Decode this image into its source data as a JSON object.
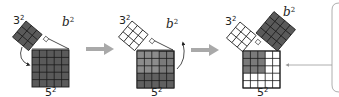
{
  "diagram": {
    "colors": {
      "dark_fill": "#5a5a5a",
      "mid_fill": "#7a7a7a",
      "grid_line": "#1a1a1a",
      "arrow_gray": "#a9a9a9",
      "bracket_gray": "#9a9a9a",
      "white": "#ffffff"
    },
    "panels": [
      {
        "id": "panel-1",
        "labels": {
          "small_square": "3",
          "small_exp": "2",
          "leg": "b",
          "leg_exp": "2",
          "big_square": "5",
          "big_exp": "2"
        },
        "small_square_fill": "dark",
        "big_square_fill": "dark",
        "arrow": "curved arrow from 3² square down to 5² square"
      },
      {
        "id": "panel-2",
        "labels": {
          "small_square": "3",
          "small_exp": "2",
          "leg": "b",
          "leg_exp": "2",
          "big_square": "5",
          "big_exp": "2"
        },
        "small_square_fill": "white",
        "big_square_fill": "mixed",
        "arrow": "curved arrow from 5² square up toward b² side"
      },
      {
        "id": "panel-3",
        "labels": {
          "small_square": "3",
          "small_exp": "2",
          "leg": "b",
          "leg_exp": "2",
          "big_square": "5",
          "big_exp": "2"
        },
        "small_square_fill": "white",
        "b_square_fill": "dark",
        "big_square_fill": "partial: top-left 3x3 gray, remainder white"
      }
    ],
    "transitions": [
      "right-arrow",
      "right-arrow"
    ],
    "callout": "bracket on right edge with leader line pointing to 5² square"
  }
}
